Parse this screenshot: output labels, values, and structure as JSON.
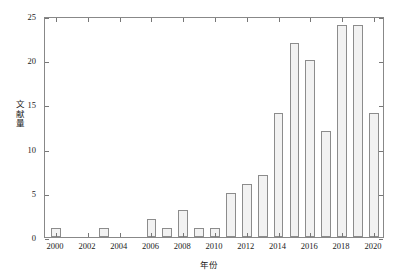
{
  "chart_data": {
    "type": "bar",
    "title": "",
    "xlabel": "年份",
    "ylabel": "文献量",
    "ylabel_chars": [
      "文",
      "献",
      "量"
    ],
    "categories": [
      2000,
      2001,
      2002,
      2003,
      2004,
      2005,
      2006,
      2007,
      2008,
      2009,
      2010,
      2011,
      2012,
      2013,
      2014,
      2015,
      2016,
      2017,
      2018,
      2019,
      2020
    ],
    "values": [
      1,
      0,
      0,
      1,
      0,
      0,
      2,
      1,
      3,
      1,
      1,
      5,
      6,
      7,
      14,
      22,
      20,
      12,
      24,
      24,
      14
    ],
    "xlim": [
      1999.3,
      2020.7
    ],
    "ylim": [
      0,
      25
    ],
    "yticks": [
      0,
      5,
      10,
      15,
      20,
      25
    ],
    "ytick_labels": [
      "0",
      "5",
      "10",
      "15",
      "20",
      "25"
    ],
    "xticks": [
      2000,
      2002,
      2004,
      2006,
      2008,
      2010,
      2012,
      2014,
      2016,
      2018,
      2020
    ],
    "xtick_labels": [
      "2000",
      "2002",
      "2004",
      "2006",
      "2008",
      "2010",
      "2012",
      "2014",
      "2016",
      "2018",
      "2020"
    ],
    "grid": false,
    "legend": null,
    "bar_fill_color": "#f2f2f2",
    "bar_edge_color": "#8c8c8c",
    "axis_color": "#888888",
    "text_color": "#1a1a1a",
    "background_color": "#ffffff",
    "bar_width_ratio": 0.62
  }
}
